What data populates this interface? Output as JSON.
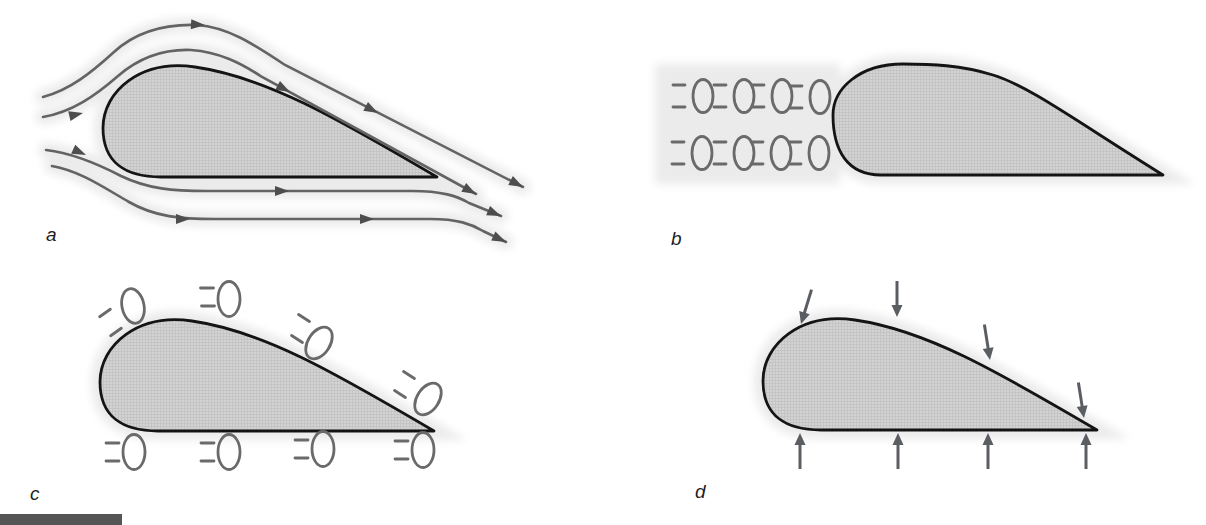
{
  "figure": {
    "type": "four-panel airfoil aerodynamics diagram",
    "panels": {
      "a": {
        "label": "a",
        "depicts": "streamlines flowing left to right around an airfoil",
        "streamline_count": 4,
        "arrowhead_count": 12
      },
      "b": {
        "label": "b",
        "depicts": "rows of air parcels (ellipses with motion dashes) approaching the airfoil leading edge",
        "molecule_rows": 2,
        "molecules_per_row": 4
      },
      "c": {
        "label": "c",
        "depicts": "air parcels (ellipses with motion dashes) distributed along the upper and lower airfoil surfaces",
        "molecules_upper": 4,
        "molecules_lower": 4
      },
      "d": {
        "label": "d",
        "depicts": "pressure arrows pressing inward on the upper and lower airfoil surfaces",
        "arrows_upper": 4,
        "arrows_lower": 4
      }
    },
    "colors": {
      "background": "#ffffff",
      "flow_gray": "#636363",
      "arrowhead": "#4d4d4d",
      "outline": "#141414",
      "fill_base": "#d3d3d3",
      "fill_grid": "#c3c3c3",
      "molecule": "#6a6a6a",
      "pressure_arrow": "#5a5e62",
      "label_color": "#1d1d1d",
      "halo": "#ebebeb",
      "footer_bar": "#555555"
    }
  }
}
